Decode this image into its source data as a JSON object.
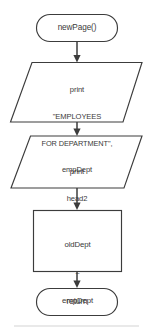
{
  "diagram": {
    "type": "flowchart",
    "background_color": "#ffffff",
    "stroke_color": "#3c3c3c",
    "text_color": "#3a3a3a",
    "nodes": [
      {
        "id": "start",
        "shape": "terminal",
        "label": "newPage()",
        "lines": [
          "newPage()"
        ]
      },
      {
        "id": "io1",
        "shape": "parallelogram",
        "label": "print \"EMPLOYEES FOR DEPARTMENT\", empDept",
        "lines": [
          "print",
          "\"EMPLOYEES",
          "FOR DEPARTMENT\",",
          "empDept"
        ],
        "line1": "print",
        "line2": "\"EMPLOYEES",
        "line3": "FOR DEPARTMENT\",",
        "line4": "empDept"
      },
      {
        "id": "io2",
        "shape": "parallelogram",
        "label": "print head2",
        "lines": [
          "print",
          "head2"
        ],
        "line1": "print",
        "line2": "head2"
      },
      {
        "id": "process",
        "shape": "rectangle",
        "label": "oldDept = empDept",
        "lines": [
          "oldDept",
          "=",
          "empDept"
        ],
        "line1": "oldDept",
        "line2": "=",
        "line3": "empDept"
      },
      {
        "id": "end",
        "shape": "terminal",
        "label": "return",
        "lines": [
          "return"
        ]
      }
    ],
    "edges": [
      {
        "from": "start",
        "to": "io1"
      },
      {
        "from": "io1",
        "to": "io2"
      },
      {
        "from": "io2",
        "to": "process"
      },
      {
        "from": "process",
        "to": "end"
      }
    ]
  }
}
